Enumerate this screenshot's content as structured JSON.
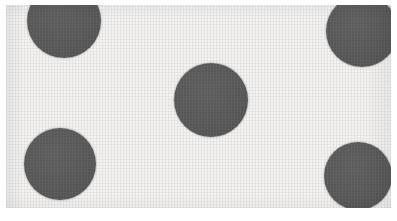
{
  "image": {
    "title": "Polka dot pattern (scanned halftone)",
    "width": 397,
    "height": 221,
    "background_color": "#ffffff",
    "paper_color": "#f4f3f1",
    "dot_color": "#565656",
    "margin_left": 6,
    "margin_top": 5,
    "margin_right": 6,
    "margin_bottom": 13
  },
  "pattern": {
    "name": "five-dot-quincunx",
    "dot_count": 5,
    "description": "Five dark gray circles arranged in a quincunx (dice-five) layout on a light paper background; the four corner dots are clipped by the edges of the scanned area.",
    "dots": [
      {
        "name": "dot-top-left",
        "cx": 64,
        "cy": 21,
        "r": 37,
        "clipped": "top"
      },
      {
        "name": "dot-top-right",
        "cx": 362,
        "cy": 31,
        "r": 36,
        "clipped": "top-right"
      },
      {
        "name": "dot-center",
        "cx": 211,
        "cy": 100,
        "r": 37,
        "clipped": "none"
      },
      {
        "name": "dot-bottom-left",
        "cx": 60,
        "cy": 164,
        "r": 36,
        "clipped": "none"
      },
      {
        "name": "dot-bottom-right",
        "cx": 358,
        "cy": 176,
        "r": 34,
        "clipped": "right-bottom"
      }
    ]
  }
}
